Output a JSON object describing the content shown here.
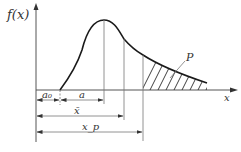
{
  "diagram": {
    "axes": {
      "y_label": "f(x)",
      "x_label": "x"
    },
    "annotations": {
      "region_label": "P",
      "dimensions": [
        {
          "id": "a0",
          "label": "a₀",
          "from": "origin",
          "to": "curve start"
        },
        {
          "id": "a",
          "label": "a",
          "from": "curve start",
          "to": "mode"
        },
        {
          "id": "xbar",
          "label": "x̄",
          "from": "origin",
          "to": "mean"
        },
        {
          "id": "xp",
          "label": "x_p",
          "from": "origin",
          "to": "x_p"
        }
      ]
    },
    "colors": {
      "curve": "#1a1a1a",
      "axes": "#555555",
      "hatch": "#2a2a2a"
    }
  }
}
